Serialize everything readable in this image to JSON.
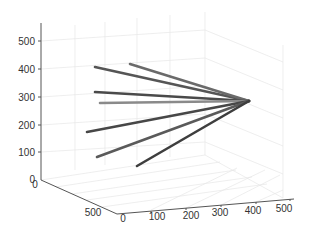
{
  "chart_data": {
    "type": "line3d",
    "title": "",
    "xlabel": "",
    "ylabel": "",
    "zlabel": "",
    "grid": true,
    "xlim": [
      0,
      500
    ],
    "ylim": [
      0,
      500
    ],
    "zlim": [
      0,
      500
    ],
    "x_ticks": [
      "0",
      "100",
      "200",
      "300",
      "400",
      "500"
    ],
    "y_ticks": [
      "0",
      "500"
    ],
    "z_ticks": [
      "0",
      "100",
      "200",
      "300",
      "400",
      "500"
    ],
    "convergence_point": {
      "screen": [
        249,
        101
      ]
    },
    "series": [
      {
        "name": "line-1",
        "start": [
          95,
          67
        ],
        "end": [
          249,
          101
        ],
        "color": "#555555"
      },
      {
        "name": "line-2",
        "start": [
          130,
          64
        ],
        "end": [
          249,
          101
        ],
        "color": "#6a6a6a"
      },
      {
        "name": "line-3",
        "start": [
          95,
          92
        ],
        "end": [
          249,
          101
        ],
        "color": "#4a4a4a"
      },
      {
        "name": "line-4",
        "start": [
          100,
          103
        ],
        "end": [
          249,
          101
        ],
        "color": "#8a8a8a"
      },
      {
        "name": "line-5",
        "start": [
          87,
          132
        ],
        "end": [
          249,
          101
        ],
        "color": "#474747"
      },
      {
        "name": "line-6",
        "start": [
          97,
          157
        ],
        "end": [
          249,
          101
        ],
        "color": "#5a5a5a"
      },
      {
        "name": "line-7",
        "start": [
          137,
          166
        ],
        "end": [
          249,
          101
        ],
        "color": "#3e3e3e"
      }
    ]
  },
  "axes": {
    "z_labels": [
      {
        "text": "500",
        "y": 41
      },
      {
        "text": "400",
        "y": 69
      },
      {
        "text": "300",
        "y": 97
      },
      {
        "text": "200",
        "y": 125
      },
      {
        "text": "100",
        "y": 152
      },
      {
        "text": "0",
        "y": 179
      }
    ],
    "y_labels": [
      {
        "text": "0",
        "x": 35,
        "y": 188
      },
      {
        "text": "500",
        "x": 93,
        "y": 216
      }
    ],
    "x_labels": [
      {
        "text": "0",
        "x": 123,
        "y": 222
      },
      {
        "text": "100",
        "x": 157,
        "y": 220
      },
      {
        "text": "200",
        "x": 191,
        "y": 219
      },
      {
        "text": "300",
        "x": 220,
        "y": 216
      },
      {
        "text": "400",
        "x": 253,
        "y": 214
      },
      {
        "text": "500",
        "x": 284,
        "y": 212
      }
    ]
  }
}
